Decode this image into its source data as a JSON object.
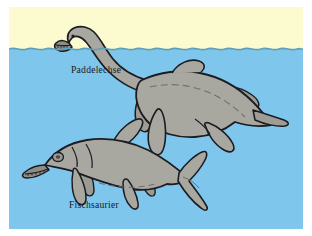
{
  "scene": {
    "title": "Paddelechse und Fischsaurier",
    "medium": "scanned colour illustration",
    "frame_background": "#ffffff",
    "sky_color": "#fbfbcf",
    "water_color": "#7fc6ec",
    "water_line_color": "#5f9fb8",
    "animal_body_color": "#a9a8a0",
    "animal_shadow_color": "#91918a",
    "outline_color": "#1b1b22",
    "label_color": "#1a1a20",
    "waterline_y_label": "horizon"
  },
  "labels": [
    {
      "id": "plesiosaur",
      "text": "Paddelechse",
      "x": 62,
      "y": 66
    },
    {
      "id": "ichthyosaur",
      "text": "Fischsaurier",
      "x": 60,
      "y": 201
    }
  ],
  "animals": [
    {
      "id": "plesiosaur",
      "common_name": "Paddelechse",
      "position": "upper",
      "description": "long-necked marine reptile with head raised above the water surface, broad body and four paddle flippers",
      "features": [
        "long neck",
        "small head with teeth",
        "barrel body",
        "four paddle flippers",
        "short tail"
      ]
    },
    {
      "id": "ichthyosaur",
      "common_name": "Fischsaurier",
      "position": "lower",
      "description": "dolphin-shaped marine reptile fully submerged, long narrow snout, dorsal fin and crescent tail fluke",
      "features": [
        "long narrow snout",
        "large eye",
        "dorsal fin",
        "two pairs of flippers",
        "crescent tail fin"
      ]
    }
  ],
  "icons": {
    "water_surface": "wave-line-icon",
    "plesiosaur_figure": "plesiosaur-icon",
    "ichthyosaur_figure": "ichthyosaur-icon"
  }
}
